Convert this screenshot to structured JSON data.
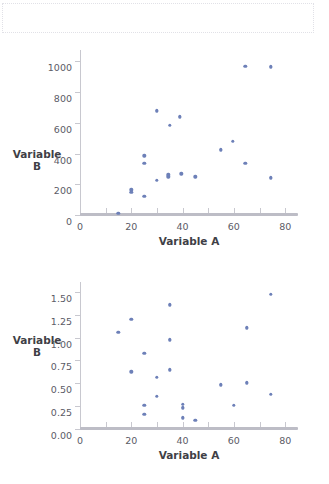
{
  "page": {
    "background": "#ffffff",
    "point_color": "#6d80b8",
    "axis_color": "#c8c8cf"
  },
  "top_placeholder": {
    "name": "empty-dotted-box",
    "text": ""
  },
  "chart_data": [
    {
      "id": "chart-top",
      "type": "scatter",
      "title": "",
      "xlabel": "Variable A",
      "ylabel": "Variable B",
      "xlim": [
        0,
        85
      ],
      "ylim": [
        0,
        1080
      ],
      "xticks": [
        0,
        20,
        40,
        60,
        80
      ],
      "xticklabels": [
        "0",
        "20",
        "40",
        "60",
        "80"
      ],
      "xminorticks": [
        10,
        30,
        50,
        70
      ],
      "yticks": [
        0,
        200,
        400,
        600,
        800,
        1000
      ],
      "yticklabels": [
        "0",
        "200",
        "400",
        "600",
        "800",
        "1000"
      ],
      "grid": false,
      "legend": null,
      "points": [
        {
          "x": 15,
          "y": 20
        },
        {
          "x": 20,
          "y": 155
        },
        {
          "x": 20,
          "y": 170
        },
        {
          "x": 25,
          "y": 130
        },
        {
          "x": 25,
          "y": 345
        },
        {
          "x": 25,
          "y": 392
        },
        {
          "x": 30,
          "y": 232
        },
        {
          "x": 30,
          "y": 685
        },
        {
          "x": 34.5,
          "y": 255
        },
        {
          "x": 34.5,
          "y": 268
        },
        {
          "x": 35,
          "y": 590
        },
        {
          "x": 39,
          "y": 645
        },
        {
          "x": 39.5,
          "y": 275
        },
        {
          "x": 45,
          "y": 255
        },
        {
          "x": 55,
          "y": 432
        },
        {
          "x": 59.5,
          "y": 487
        },
        {
          "x": 64.5,
          "y": 345
        },
        {
          "x": 64.5,
          "y": 975
        },
        {
          "x": 74.5,
          "y": 250
        },
        {
          "x": 74.5,
          "y": 972
        }
      ]
    },
    {
      "id": "chart-bottom",
      "type": "scatter",
      "title": "",
      "xlabel": "Variable A",
      "ylabel": "Variable B",
      "xlim": [
        0,
        85
      ],
      "ylim": [
        0,
        1.62
      ],
      "xticks": [
        0,
        20,
        40,
        60,
        80
      ],
      "xticklabels": [
        "0",
        "20",
        "40",
        "60",
        "80"
      ],
      "xminorticks": [
        10,
        30,
        50,
        70
      ],
      "yticks": [
        0.0,
        0.25,
        0.5,
        0.75,
        1.0,
        1.25,
        1.5
      ],
      "yticklabels": [
        "0.00",
        "0.25",
        "0.50",
        "0.75",
        "1.00",
        "1.25",
        "1.50"
      ],
      "grid": false,
      "legend": null,
      "points": [
        {
          "x": 15,
          "y": 1.07
        },
        {
          "x": 20,
          "y": 1.21
        },
        {
          "x": 20,
          "y": 0.64
        },
        {
          "x": 25,
          "y": 0.84
        },
        {
          "x": 25,
          "y": 0.27
        },
        {
          "x": 25,
          "y": 0.17
        },
        {
          "x": 30,
          "y": 0.575
        },
        {
          "x": 30,
          "y": 0.37
        },
        {
          "x": 35,
          "y": 1.37
        },
        {
          "x": 35,
          "y": 0.99
        },
        {
          "x": 35,
          "y": 0.66
        },
        {
          "x": 40,
          "y": 0.285
        },
        {
          "x": 40,
          "y": 0.245
        },
        {
          "x": 40,
          "y": 0.135
        },
        {
          "x": 45,
          "y": 0.105
        },
        {
          "x": 55,
          "y": 0.495
        },
        {
          "x": 60,
          "y": 0.27
        },
        {
          "x": 65,
          "y": 1.12
        },
        {
          "x": 65,
          "y": 0.52
        },
        {
          "x": 74.5,
          "y": 1.49
        },
        {
          "x": 74.5,
          "y": 0.39
        }
      ]
    }
  ]
}
